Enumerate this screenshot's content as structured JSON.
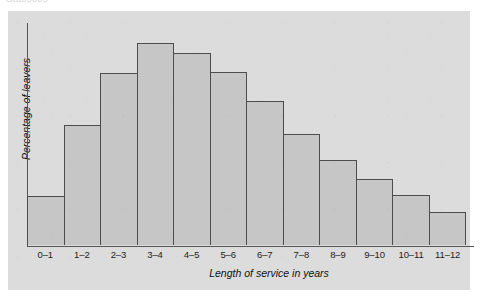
{
  "caption": {
    "clipped_text": "Statistics"
  },
  "chart_data": {
    "type": "bar",
    "title": "",
    "subtitle": "",
    "xlabel": "Length of service in years",
    "ylabel": "Percentage of leavers",
    "categories": [
      "0–1",
      "1–2",
      "2–3",
      "3–4",
      "4–5",
      "5–6",
      "6–7",
      "7–8",
      "8–9",
      "9–10",
      "10–11",
      "11–12"
    ],
    "values": [
      3.4,
      8.3,
      11.9,
      14.0,
      13.3,
      12.0,
      10.0,
      7.7,
      5.9,
      4.6,
      3.5,
      2.3
    ],
    "bar_pixel_heights": [
      52,
      128,
      183,
      215,
      204,
      185,
      153,
      118,
      90,
      71,
      53,
      35
    ],
    "ylim": [
      0,
      15.4
    ],
    "xlim_labels_shown": true,
    "y_tick_labels": [],
    "grid": false,
    "legend": null,
    "legend_position": "none",
    "annotations": []
  },
  "style": {
    "panel_background": "#dcdcdc",
    "page_background": "#ffffff",
    "bar_fill": "#c6c6c6",
    "bar_border": "#4d4d4d",
    "axis_line": "#555555",
    "text_color": "#111111"
  }
}
